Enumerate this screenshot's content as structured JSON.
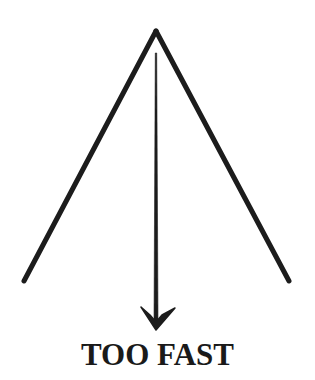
{
  "figure": {
    "caption": "TOO FAST",
    "stroke_color": "#1c1c1c",
    "background_color": "#ffffff",
    "apex": {
      "x": 156,
      "y": 31
    },
    "left_leg_end": {
      "x": 24,
      "y": 281
    },
    "right_leg_end": {
      "x": 289,
      "y": 281
    },
    "arrow": {
      "shaft_top": {
        "x": 156,
        "y": 53
      },
      "shaft_bottom": {
        "x": 156,
        "y": 322
      },
      "head_tip": {
        "x": 156,
        "y": 330
      },
      "head_left": {
        "x": 141,
        "y": 307
      },
      "head_right": {
        "x": 175,
        "y": 308
      },
      "direction": "down"
    },
    "icons": [
      "triangle-outline",
      "arrow-down-icon"
    ]
  }
}
